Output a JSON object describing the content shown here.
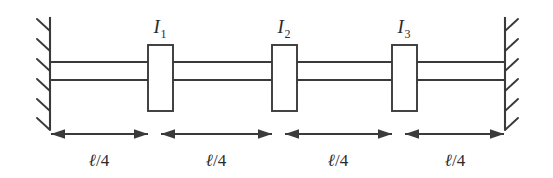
{
  "figure": {
    "kind": "torsional-shaft-diagram",
    "background_color": "#ffffff",
    "line_color": "#3a3a3a",
    "text_color": "#2b2b2b",
    "width": 553,
    "height": 178
  },
  "walls": {
    "left": {
      "name": "fixed-support-left",
      "x": 50,
      "y_top": 18,
      "y_bottom": 129,
      "hatch_direction": "upper-left",
      "hatch_count": 6
    },
    "right": {
      "name": "fixed-support-right",
      "x": 505,
      "y_top": 18,
      "y_bottom": 129,
      "hatch_direction": "upper-right",
      "hatch_count": 6
    }
  },
  "shaft": {
    "name": "shaft",
    "top_line_y": 62,
    "bottom_line_y": 80,
    "x_start": 50,
    "x_end": 505
  },
  "disks": [
    {
      "label_base": "I",
      "label_sub": "1",
      "label_full": "I1",
      "x": 148,
      "y": 45,
      "width": 25,
      "height": 66,
      "label_x": 160,
      "label_y": 33
    },
    {
      "label_base": "I",
      "label_sub": "2",
      "label_full": "I2",
      "x": 272,
      "y": 45,
      "width": 25,
      "height": 66,
      "label_x": 284,
      "label_y": 33
    },
    {
      "label_base": "I",
      "label_sub": "3",
      "label_full": "I3",
      "x": 392,
      "y": 45,
      "width": 25,
      "height": 66,
      "label_x": 404,
      "label_y": 33
    }
  ],
  "dimensions": {
    "arrow_y": 134,
    "label_y": 166,
    "segments": [
      {
        "label_ell": "ℓ",
        "label_rest": "/4",
        "label_full": "ℓ/4",
        "x_start": 51,
        "x_end": 148,
        "label_x": 99
      },
      {
        "label_ell": "ℓ",
        "label_rest": "/4",
        "label_full": "ℓ/4",
        "x_start": 161,
        "x_end": 272,
        "label_x": 216
      },
      {
        "label_ell": "ℓ",
        "label_rest": "/4",
        "label_full": "ℓ/4",
        "x_start": 285,
        "x_end": 392,
        "label_x": 338
      },
      {
        "label_ell": "ℓ",
        "label_rest": "/4",
        "label_full": "ℓ/4",
        "x_start": 405,
        "x_end": 504,
        "label_x": 455
      }
    ]
  }
}
